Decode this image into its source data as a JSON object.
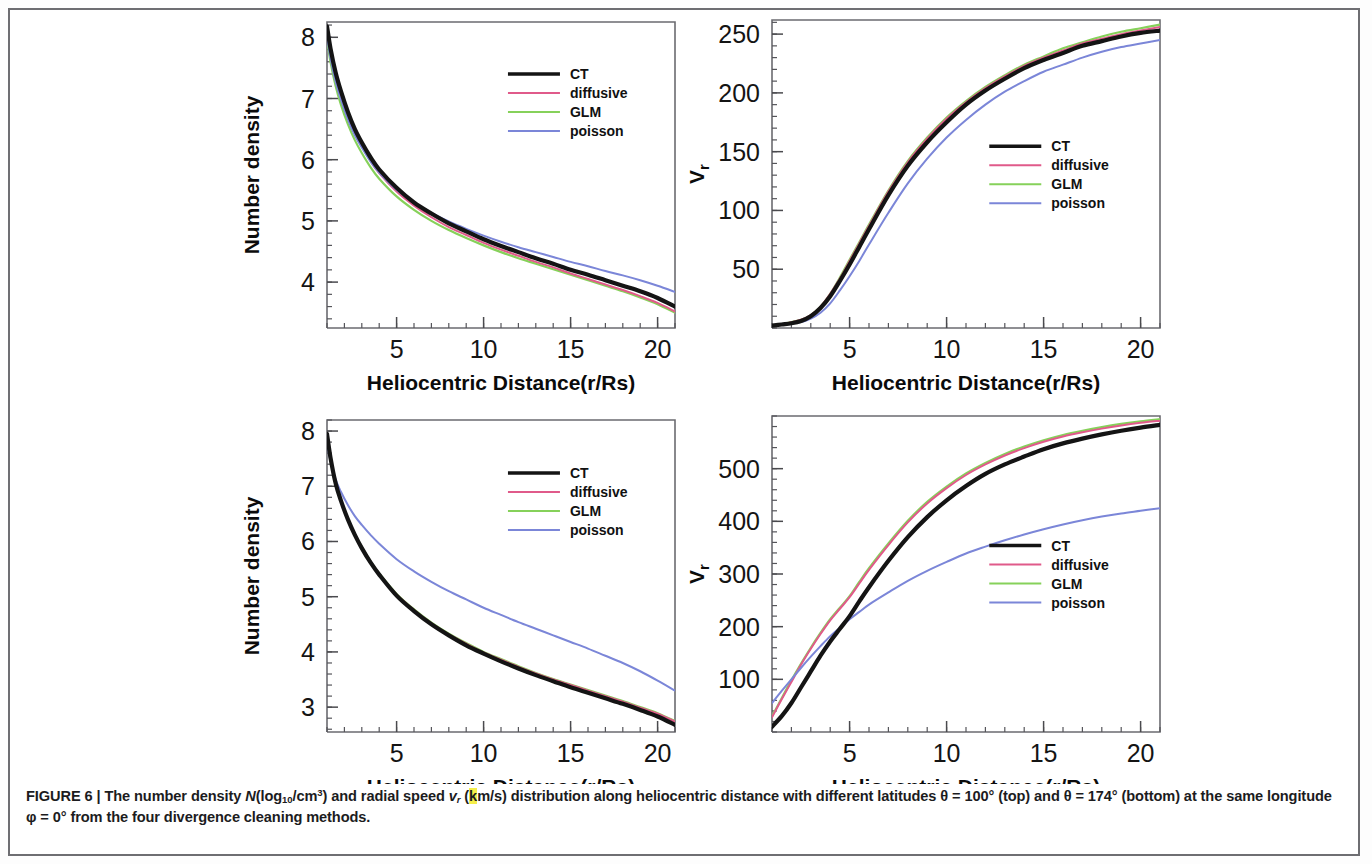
{
  "figure": {
    "label": "FIGURE 6",
    "separator": "|",
    "caption_line1_a": "The number density ",
    "caption_N": "N",
    "caption_log": "(log",
    "caption_log_sub": "10",
    "caption_cm": "/cm",
    "caption_cm_sup": "3",
    "caption_close": ") and radial speed ",
    "caption_v": "v",
    "caption_v_sub": "r",
    "caption_units_open": " (",
    "caption_units_k": "k",
    "caption_units_rest": "m/s)",
    "caption_line1_b": " distribution along heliocentric distance with different latitudes ",
    "caption_theta1": "θ = 100°",
    "caption_top": " (top)",
    "caption_line2_a": "and ",
    "caption_theta2": "θ = 174°",
    "caption_bottom": " (bottom) at the same longitude ",
    "caption_phi": "φ = 0°",
    "caption_line2_b": " from the four divergence cleaning methods.",
    "highlight_color": "#f5ee4a"
  },
  "series_colors": {
    "CT": "#141414",
    "diffusive": "#e05a8a",
    "GLM": "#86d15a",
    "poisson": "#7b86d8"
  },
  "legend": {
    "entries": [
      {
        "label": "CT",
        "color": "#141414",
        "width": 3.6
      },
      {
        "label": "diffusive",
        "color": "#e05a8a",
        "width": 1.9
      },
      {
        "label": "GLM",
        "color": "#86d15a",
        "width": 1.9
      },
      {
        "label": "poisson",
        "color": "#7b86d8",
        "width": 1.9
      }
    ]
  },
  "chart_data": [
    {
      "id": "top-left",
      "type": "line",
      "title": "",
      "xlabel": "Heliocentric Distance(r/Rs)",
      "ylabel": "Number density",
      "xlim": [
        1,
        21
      ],
      "ylim": [
        3.25,
        8.25
      ],
      "xticks": [
        5,
        10,
        15,
        20
      ],
      "yticks": [
        4,
        5,
        6,
        7,
        8
      ],
      "minor_x_per": 5,
      "minor_y_per": 5,
      "grid": false,
      "legend_position": "upper-right",
      "x": [
        1,
        1.2,
        1.5,
        1.8,
        2.2,
        2.6,
        3,
        3.5,
        4,
        5,
        6,
        7,
        8,
        9,
        10,
        11,
        12,
        13,
        14,
        15,
        16,
        17,
        18,
        19,
        20,
        21
      ],
      "series": [
        {
          "name": "CT",
          "values": [
            8.18,
            7.82,
            7.42,
            7.12,
            6.78,
            6.5,
            6.28,
            6.04,
            5.84,
            5.54,
            5.3,
            5.12,
            4.96,
            4.83,
            4.7,
            4.59,
            4.49,
            4.39,
            4.3,
            4.2,
            4.12,
            4.03,
            3.94,
            3.85,
            3.74,
            3.6
          ]
        },
        {
          "name": "diffusive",
          "values": [
            8.15,
            7.78,
            7.37,
            7.06,
            6.72,
            6.44,
            6.22,
            5.98,
            5.78,
            5.48,
            5.25,
            5.06,
            4.9,
            4.77,
            4.64,
            4.53,
            4.43,
            4.33,
            4.24,
            4.14,
            4.05,
            3.96,
            3.87,
            3.77,
            3.66,
            3.52
          ]
        },
        {
          "name": "GLM",
          "values": [
            7.98,
            7.6,
            7.2,
            6.9,
            6.58,
            6.32,
            6.11,
            5.88,
            5.69,
            5.4,
            5.18,
            5.0,
            4.85,
            4.72,
            4.6,
            4.49,
            4.39,
            4.3,
            4.21,
            4.12,
            4.03,
            3.94,
            3.85,
            3.75,
            3.64,
            3.5
          ]
        },
        {
          "name": "poisson",
          "values": [
            8.02,
            7.66,
            7.27,
            6.98,
            6.66,
            6.4,
            6.2,
            5.97,
            5.79,
            5.51,
            5.3,
            5.13,
            4.99,
            4.87,
            4.76,
            4.66,
            4.57,
            4.49,
            4.41,
            4.33,
            4.26,
            4.18,
            4.11,
            4.03,
            3.94,
            3.84
          ]
        }
      ]
    },
    {
      "id": "top-right",
      "type": "line",
      "title": "",
      "xlabel": "Heliocentric Distance(r/Rs)",
      "ylabel": "Vr",
      "xlim": [
        1,
        21
      ],
      "ylim": [
        0,
        262
      ],
      "xticks": [
        5,
        10,
        15,
        20
      ],
      "yticks": [
        50,
        100,
        150,
        200,
        250
      ],
      "minor_x_per": 5,
      "minor_y_per": 5,
      "grid": false,
      "legend_position": "center-right",
      "x": [
        1,
        1.5,
        2,
        2.5,
        3,
        3.5,
        4,
        4.5,
        5,
        5.5,
        6,
        7,
        8,
        9,
        10,
        11,
        12,
        13,
        14,
        15,
        16,
        17,
        18,
        19,
        20,
        21
      ],
      "series": [
        {
          "name": "CT",
          "values": [
            2,
            3,
            4,
            6,
            10,
            17,
            27,
            40,
            54,
            69,
            84,
            113,
            138,
            158,
            175,
            190,
            202,
            212,
            221,
            228,
            234,
            240,
            244,
            248,
            251,
            253
          ]
        },
        {
          "name": "diffusive",
          "values": [
            2,
            3,
            5,
            7,
            11,
            18,
            29,
            42,
            57,
            72,
            87,
            116,
            141,
            161,
            178,
            192,
            204,
            214,
            223,
            230,
            236,
            242,
            246,
            250,
            253,
            256
          ]
        },
        {
          "name": "GLM",
          "values": [
            2,
            3,
            5,
            7,
            11,
            18,
            29,
            43,
            58,
            73,
            88,
            117,
            142,
            162,
            179,
            193,
            205,
            215,
            224,
            231,
            238,
            243,
            248,
            252,
            255,
            258
          ]
        },
        {
          "name": "poisson",
          "values": [
            2,
            3,
            4,
            5,
            8,
            13,
            21,
            32,
            44,
            57,
            71,
            98,
            123,
            144,
            162,
            177,
            190,
            201,
            210,
            218,
            224,
            230,
            235,
            239,
            242,
            245
          ]
        }
      ]
    },
    {
      "id": "bottom-left",
      "type": "line",
      "title": "",
      "xlabel": "Heliocentric Distance(r/Rs)",
      "ylabel": "Number density",
      "xlim": [
        1,
        21
      ],
      "ylim": [
        2.55,
        8.2
      ],
      "xticks": [
        5,
        10,
        15,
        20
      ],
      "yticks": [
        3,
        4,
        5,
        6,
        7,
        8
      ],
      "minor_x_per": 5,
      "minor_y_per": 5,
      "grid": false,
      "legend_position": "upper-right",
      "x": [
        1,
        1.2,
        1.5,
        1.8,
        2.2,
        2.6,
        3,
        3.5,
        4,
        5,
        6,
        7,
        8,
        9,
        10,
        11,
        12,
        13,
        14,
        15,
        16,
        17,
        18,
        19,
        20,
        21
      ],
      "series": [
        {
          "name": "CT",
          "values": [
            7.95,
            7.52,
            7.05,
            6.74,
            6.4,
            6.12,
            5.88,
            5.62,
            5.4,
            5.02,
            4.74,
            4.5,
            4.3,
            4.12,
            3.97,
            3.83,
            3.7,
            3.58,
            3.47,
            3.36,
            3.26,
            3.16,
            3.06,
            2.95,
            2.83,
            2.68
          ]
        },
        {
          "name": "diffusive",
          "values": [
            7.94,
            7.5,
            7.03,
            6.73,
            6.4,
            6.12,
            5.89,
            5.63,
            5.41,
            5.04,
            4.76,
            4.52,
            4.32,
            4.15,
            3.99,
            3.86,
            3.73,
            3.61,
            3.5,
            3.4,
            3.3,
            3.2,
            3.1,
            2.99,
            2.88,
            2.74
          ]
        },
        {
          "name": "GLM",
          "values": [
            7.93,
            7.5,
            7.04,
            6.74,
            6.41,
            6.13,
            5.9,
            5.64,
            5.42,
            5.05,
            4.77,
            4.53,
            4.33,
            4.16,
            4.0,
            3.87,
            3.74,
            3.62,
            3.51,
            3.41,
            3.31,
            3.21,
            3.11,
            3.0,
            2.89,
            2.75
          ]
        },
        {
          "name": "poisson",
          "values": [
            7.78,
            7.46,
            7.12,
            6.9,
            6.66,
            6.46,
            6.3,
            6.12,
            5.96,
            5.68,
            5.46,
            5.27,
            5.1,
            4.95,
            4.8,
            4.67,
            4.54,
            4.42,
            4.3,
            4.18,
            4.06,
            3.93,
            3.8,
            3.65,
            3.48,
            3.3
          ]
        }
      ]
    },
    {
      "id": "bottom-right",
      "type": "line",
      "title": "",
      "xlabel": "Heliocentric Distance(r/Rs)",
      "ylabel": "Vr",
      "xlim": [
        1,
        21
      ],
      "ylim": [
        0,
        600
      ],
      "xticks": [
        5,
        10,
        15,
        20
      ],
      "yticks": [
        100,
        200,
        300,
        400,
        500
      ],
      "minor_x_per": 5,
      "minor_y_per": 5,
      "grid": false,
      "legend_position": "center-right",
      "x": [
        1,
        1.5,
        2,
        2.5,
        3,
        3.5,
        4,
        4.5,
        5,
        5.5,
        6,
        7,
        8,
        9,
        10,
        11,
        12,
        13,
        14,
        15,
        16,
        17,
        18,
        19,
        20,
        21
      ],
      "series": [
        {
          "name": "CT",
          "values": [
            10,
            30,
            55,
            85,
            115,
            145,
            172,
            196,
            220,
            248,
            275,
            325,
            370,
            408,
            440,
            467,
            490,
            508,
            523,
            537,
            548,
            557,
            565,
            572,
            578,
            583
          ]
        },
        {
          "name": "diffusive",
          "values": [
            28,
            62,
            95,
            128,
            158,
            186,
            212,
            234,
            256,
            282,
            308,
            355,
            398,
            434,
            463,
            488,
            508,
            525,
            539,
            551,
            561,
            569,
            576,
            582,
            587,
            591
          ]
        },
        {
          "name": "GLM",
          "values": [
            30,
            64,
            98,
            130,
            160,
            188,
            214,
            236,
            258,
            285,
            311,
            358,
            401,
            437,
            466,
            491,
            511,
            528,
            542,
            554,
            564,
            572,
            579,
            585,
            590,
            594
          ]
        },
        {
          "name": "poisson",
          "values": [
            55,
            78,
            100,
            122,
            143,
            163,
            182,
            198,
            214,
            228,
            242,
            265,
            287,
            306,
            323,
            339,
            352,
            364,
            375,
            385,
            394,
            402,
            409,
            415,
            420,
            425
          ]
        }
      ]
    }
  ]
}
